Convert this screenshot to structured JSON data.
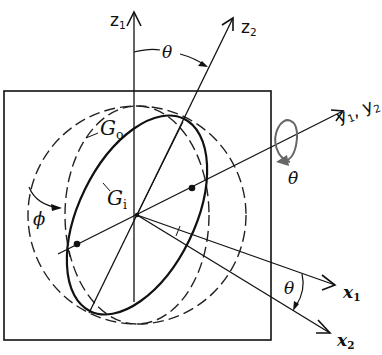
{
  "diagram": {
    "frame_box": {
      "x": 4,
      "y": 91,
      "w": 267,
      "h": 249
    },
    "colors": {
      "stroke": "#111111",
      "background": "#ffffff"
    },
    "labels": {
      "z1": {
        "base": "z",
        "sub": "1"
      },
      "z2": {
        "base": "z",
        "sub": "2"
      },
      "y12": {
        "text": "y",
        "sub1": "1",
        "sep": ", y",
        "sub2": "2"
      },
      "x1": {
        "base": "x",
        "sub": "1"
      },
      "x2": {
        "base": "x",
        "sub": "2"
      },
      "theta_top": "θ",
      "theta_bottom": "θ",
      "theta_dot": "θ̇",
      "phi": "ϕ",
      "Go": {
        "base": "G",
        "sub": "o"
      },
      "Gi": {
        "base": "G",
        "sub": "i"
      }
    },
    "elements": {
      "outer_gimbal_dashed_circle": {
        "cx": 137,
        "cy": 215,
        "r": 109
      },
      "Go_dashed_ellipse": {
        "cx": 137,
        "cy": 215,
        "rx": 72,
        "ry": 109
      },
      "Gi_solid_ellipse": {
        "cx": 137,
        "cy": 215,
        "rx": 58,
        "ry": 107,
        "rotate_deg": 26
      },
      "axes": {
        "z1": {
          "from": [
            134,
            300
          ],
          "to": [
            134,
            12
          ]
        },
        "z2": {
          "from": [
            90,
            310
          ],
          "to": [
            233,
            18
          ]
        },
        "y": {
          "from": [
            77,
            244
          ],
          "to": [
            343,
            111
          ]
        },
        "x1": {
          "from": [
            137,
            215
          ],
          "to": [
            335,
            285
          ]
        },
        "x2": {
          "from": [
            137,
            215
          ],
          "to": [
            330,
            333
          ]
        }
      }
    }
  }
}
